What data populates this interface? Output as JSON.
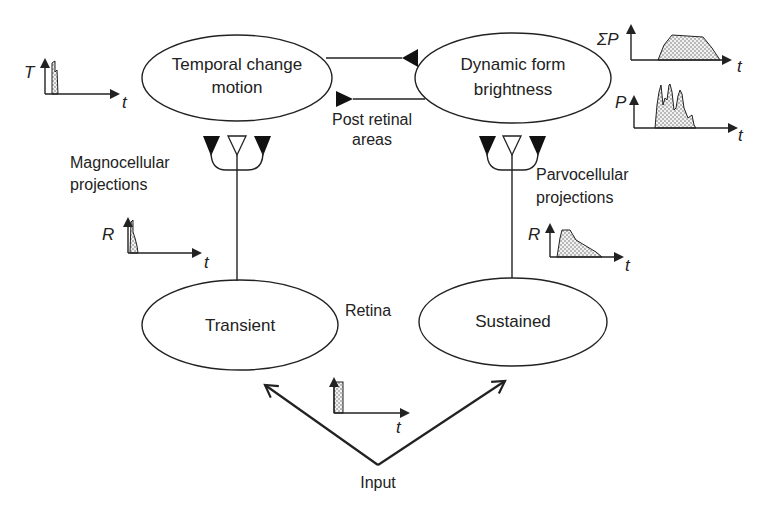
{
  "diagram": {
    "nodes": {
      "temporal": {
        "line1": "Temporal change",
        "line2": "motion"
      },
      "dynamic": {
        "line1": "Dynamic form",
        "line2": "brightness"
      },
      "transient": {
        "label": "Transient"
      },
      "sustained": {
        "label": "Sustained"
      }
    },
    "labels": {
      "post_retinal_1": "Post retinal",
      "post_retinal_2": "areas",
      "magno_1": "Magnocellular",
      "magno_2": "projections",
      "parvo_1": "Parvocellular",
      "parvo_2": "projections",
      "retina": "Retina",
      "input": "Input"
    },
    "mini_plots": {
      "temporal": {
        "y_label": "T",
        "x_label": "t",
        "shape": "narrow spike"
      },
      "sum_p": {
        "y_label": "ΣP",
        "x_label": "t",
        "shape": "sustained plateau"
      },
      "p": {
        "y_label": "P",
        "x_label": "t",
        "shape": "multiple spikes"
      },
      "magno_r": {
        "y_label": "R",
        "x_label": "t",
        "shape": "narrow transient spike"
      },
      "parvo_r": {
        "y_label": "R",
        "x_label": "t",
        "shape": "sustained decaying response"
      },
      "input": {
        "y_label": "",
        "x_label": "t",
        "shape": "narrow pulse"
      }
    },
    "colors": {
      "line": "#222222",
      "background": "#ffffff"
    }
  }
}
